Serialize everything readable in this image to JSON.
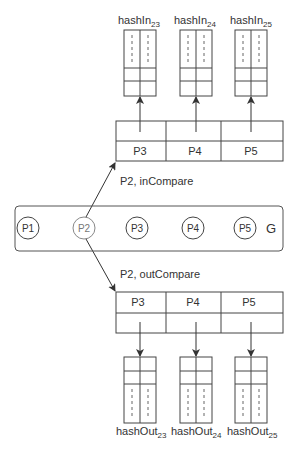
{
  "graph": {
    "label": "G",
    "nodes": [
      {
        "id": "P1",
        "label": "P1",
        "cx": 28,
        "highlight": false
      },
      {
        "id": "P2",
        "label": "P2",
        "cx": 84,
        "highlight": true
      },
      {
        "id": "P3",
        "label": "P3",
        "cx": 137,
        "highlight": false
      },
      {
        "id": "P4",
        "label": "P4",
        "cx": 193,
        "highlight": false
      },
      {
        "id": "P5",
        "label": "P5",
        "cx": 245,
        "highlight": false
      }
    ]
  },
  "top_table": {
    "edge_label": "P2, inCompare",
    "cells": [
      "P3",
      "P4",
      "P5"
    ]
  },
  "bottom_table": {
    "edge_label": "P2, outCompare",
    "cells": [
      "P3",
      "P4",
      "P5"
    ]
  },
  "hash_in": [
    {
      "base": "hashIn",
      "sub": "23"
    },
    {
      "base": "hashIn",
      "sub": "24"
    },
    {
      "base": "hashIn",
      "sub": "25"
    }
  ],
  "hash_out": [
    {
      "base": "hashOut",
      "sub": "23"
    },
    {
      "base": "hashOut",
      "sub": "24"
    },
    {
      "base": "hashOut",
      "sub": "25"
    }
  ],
  "colors": {
    "line": "#444444",
    "highlight_node": "#888888"
  }
}
